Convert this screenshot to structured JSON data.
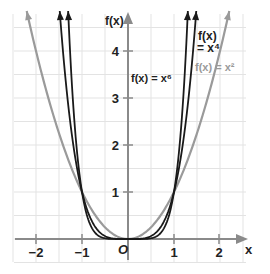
{
  "chart_data": {
    "type": "line",
    "title": "",
    "xlabel": "x",
    "ylabel": "f(x)",
    "origin_label": "O",
    "xlim": [
      -2.45,
      2.6
    ],
    "ylim": [
      -0.35,
      4.8
    ],
    "grid": true,
    "grid_step": 0.5,
    "x_ticks": [
      -2,
      -1,
      1,
      2
    ],
    "x_tick_labels": [
      "−2",
      "−1",
      "1",
      "2"
    ],
    "y_ticks": [
      1,
      2,
      3,
      4
    ],
    "y_tick_labels": [
      "1",
      "2",
      "3",
      "4"
    ],
    "series": [
      {
        "name": "f(x) = x^2",
        "label": "f(x) = x²",
        "exponent": 2,
        "color": "#9a9a9a",
        "x": [
          -2.2,
          -2,
          -1.5,
          -1,
          -0.5,
          0,
          0.5,
          1,
          1.5,
          2,
          2.15
        ],
        "values": [
          4.84,
          4,
          2.25,
          1,
          0.25,
          0,
          0.25,
          1,
          2.25,
          4,
          4.62
        ]
      },
      {
        "name": "f(x) = x^4",
        "label_line1": "f(x)",
        "label_line2": "= x⁴",
        "exponent": 4,
        "color": "#1a1a1a",
        "x": [
          -1.48,
          -1.25,
          -1,
          -0.5,
          0,
          0.5,
          1,
          1.25,
          1.48
        ],
        "values": [
          4.8,
          2.44,
          1,
          0.0625,
          0,
          0.0625,
          1,
          2.44,
          4.8
        ]
      },
      {
        "name": "f(x) = x^6",
        "label": "f(x) = x⁶",
        "exponent": 6,
        "color": "#1a1a1a",
        "x": [
          -1.3,
          -1.15,
          -1,
          -0.5,
          0,
          0.5,
          1,
          1.15,
          1.3
        ],
        "values": [
          4.83,
          2.31,
          1,
          0.0156,
          0,
          0.0156,
          1,
          2.31,
          4.83
        ]
      }
    ],
    "annotations": [
      {
        "text": "f(x) = x⁶",
        "near": [
          0.4,
          3.4
        ]
      },
      {
        "text": "f(x) = x⁴",
        "near": [
          1.3,
          4.3
        ]
      },
      {
        "text": "f(x) = x²",
        "near": [
          1.6,
          3.6
        ]
      }
    ]
  },
  "labels": {
    "x_axis": "x",
    "y_axis": "f(x)",
    "origin": "O",
    "x6": "f(x) = x⁶",
    "x4_line1": "f(x)",
    "x4_line2": "= x⁴",
    "x2": "f(x) = x²",
    "xt_m2": "−2",
    "xt_m1": "−1",
    "xt_1": "1",
    "xt_2": "2",
    "yt_1": "1",
    "yt_2": "2",
    "yt_3": "3",
    "yt_4": "4"
  }
}
